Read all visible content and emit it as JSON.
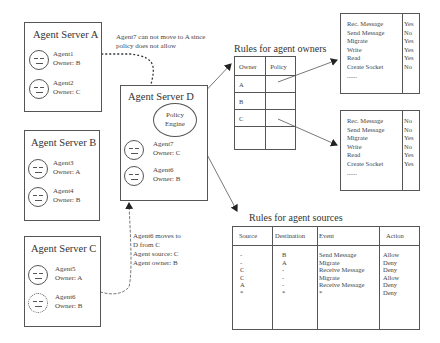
{
  "servers": [
    {
      "id": "A",
      "title": "Agent Server  A",
      "agents": [
        {
          "name": "Agent1",
          "owner": "Owner: B"
        },
        {
          "name": "Agent2",
          "owner": "Owner: C"
        }
      ]
    },
    {
      "id": "B",
      "title": "Agent Server  B",
      "agents": [
        {
          "name": "Agent3",
          "owner": "Owner: A"
        },
        {
          "name": "Agent4",
          "owner": "Owner: B"
        }
      ]
    },
    {
      "id": "C",
      "title": "Agent Server  C",
      "agents": [
        {
          "name": "Agent5",
          "owner": "Owner: A"
        },
        {
          "name": "Agent6",
          "owner": "Owner: B",
          "ghost": true
        }
      ]
    },
    {
      "id": "D",
      "title": "Agent Server  D",
      "engine": "Policy Engine",
      "engine_line1": "Policy",
      "engine_line2": "Engine",
      "agents": [
        {
          "name": "Agent7",
          "owner": "Owner: C"
        },
        {
          "name": "Agent6",
          "owner": "Owner: B"
        }
      ]
    }
  ],
  "notes": {
    "denied_move_line1": "Agent7 can not move to A since",
    "denied_move_line2": "policy does not allow",
    "move_line1": "Agent6 moves to",
    "move_line2": "D from C",
    "move_line3": "Agent source: C",
    "move_line4": "Agent owner: B"
  },
  "owner_rules": {
    "title": "Rules for agent owners",
    "headers": [
      "Owner",
      "Policy"
    ],
    "rows": [
      [
        "A",
        ""
      ],
      [
        "B",
        ""
      ],
      [
        "C",
        ""
      ],
      [
        "",
        ""
      ]
    ]
  },
  "policies": [
    {
      "for_owner": "A",
      "rows": [
        [
          "Rec. Message",
          "Yes"
        ],
        [
          "Send Message",
          "No"
        ],
        [
          "Migrate",
          "Yes"
        ],
        [
          "Write",
          "Yes"
        ],
        [
          "Read",
          "Yes"
        ],
        [
          "Create Socket",
          "No"
        ],
        [
          "......",
          ""
        ]
      ]
    },
    {
      "for_owner": "C",
      "rows": [
        [
          "Rec. Message",
          "No"
        ],
        [
          "Send Message",
          "No"
        ],
        [
          "Migrate",
          "Yes"
        ],
        [
          "Write",
          "No"
        ],
        [
          "Read",
          "Yes"
        ],
        [
          "Create Socket",
          "Yes"
        ],
        [
          "......",
          ""
        ]
      ]
    }
  ],
  "source_rules": {
    "title": "Rules for agent sources",
    "headers": [
      "Source",
      "Destination",
      "Event",
      "Action"
    ],
    "rows": [
      [
        "-",
        "B",
        "Send Message",
        "Allow"
      ],
      [
        "-",
        "A",
        "Migrate",
        "Deny"
      ],
      [
        "C",
        "-",
        "Receive Message",
        "Deny"
      ],
      [
        "C",
        "-",
        "Migrate",
        "Allow"
      ],
      [
        "A",
        "-",
        "Receive Message",
        "Deny"
      ],
      [
        "*",
        "*",
        "*",
        "Deny"
      ]
    ]
  },
  "colors": {
    "line": "#555555",
    "text": "#333333",
    "background": "#ffffff"
  }
}
